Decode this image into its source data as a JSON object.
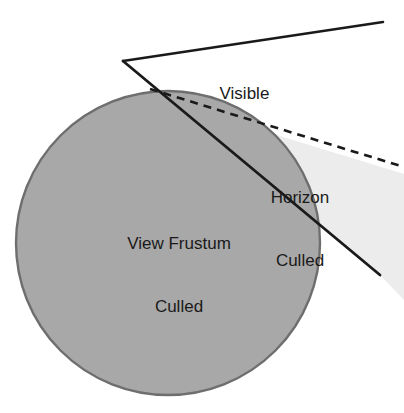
{
  "figure": {
    "kind": "horizon-culling-diagram",
    "background_color": "#ffffff"
  },
  "labels": {
    "visible": "Visible",
    "horizon_culled_line1": "Horizon",
    "horizon_culled_line2": "Culled",
    "view_frustum_culled_line1": "View Frustum",
    "view_frustum_culled_line2": "Culled"
  },
  "colors": {
    "planet_fill": "#a8a8a8",
    "planet_stroke": "#6e6e6e",
    "horizon_region_fill": "#ececec",
    "frustum_line": "#1a1a1a",
    "horizon_dashed_line": "#1a1a1a",
    "text": "#1a1a1a"
  },
  "geometry": {
    "planet": {
      "cx": 168,
      "cy": 243,
      "r": 152
    },
    "frustum_apex": {
      "x": 123,
      "y": 61
    },
    "frustum_upper_end": {
      "x": 383,
      "y": 22
    },
    "frustum_lower_end": {
      "x": 380,
      "y": 275
    },
    "horizon_tangent_start": {
      "x": 152,
      "y": 90
    },
    "horizon_tangent_end": {
      "x": 404,
      "y": 167
    }
  }
}
